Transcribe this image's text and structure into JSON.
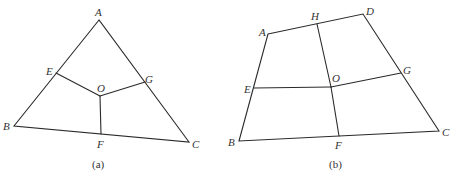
{
  "figures": [
    {
      "id": "a",
      "caption": "(a)",
      "shape": "triangle",
      "points": {
        "A": {
          "label": "A",
          "x": 99,
          "y": 20
        },
        "B": {
          "label": "B",
          "x": 14,
          "y": 126
        },
        "C": {
          "label": "C",
          "x": 189,
          "y": 142
        },
        "E": {
          "label": "E",
          "x": 56,
          "y": 73
        },
        "G": {
          "label": "G",
          "x": 145,
          "y": 82
        },
        "O": {
          "label": "O",
          "x": 100,
          "y": 96
        },
        "F": {
          "label": "F",
          "x": 101,
          "y": 134
        }
      },
      "edges": [
        [
          "A",
          "B"
        ],
        [
          "B",
          "C"
        ],
        [
          "C",
          "A"
        ],
        [
          "E",
          "O"
        ],
        [
          "G",
          "O"
        ],
        [
          "O",
          "F"
        ]
      ]
    },
    {
      "id": "b",
      "caption": "(b)",
      "shape": "quadrilateral",
      "points": {
        "A": {
          "label": "A",
          "x": 268,
          "y": 34
        },
        "H": {
          "label": "H",
          "x": 317,
          "y": 24
        },
        "D": {
          "label": "D",
          "x": 363,
          "y": 14
        },
        "E": {
          "label": "E",
          "x": 254,
          "y": 88
        },
        "O": {
          "label": "O",
          "x": 331,
          "y": 87
        },
        "G": {
          "label": "G",
          "x": 401,
          "y": 73
        },
        "B": {
          "label": "B",
          "x": 239,
          "y": 141
        },
        "F": {
          "label": "F",
          "x": 339,
          "y": 136
        },
        "C": {
          "label": "C",
          "x": 439,
          "y": 131
        }
      },
      "edges": [
        [
          "A",
          "D"
        ],
        [
          "D",
          "C"
        ],
        [
          "C",
          "B"
        ],
        [
          "B",
          "A"
        ],
        [
          "H",
          "O"
        ],
        [
          "O",
          "F"
        ],
        [
          "E",
          "O"
        ],
        [
          "O",
          "G"
        ]
      ]
    }
  ],
  "labels": {
    "a": {
      "A": "A",
      "B": "B",
      "C": "C",
      "E": "E",
      "G": "G",
      "O": "O",
      "F": "F",
      "caption": "(a)"
    },
    "b": {
      "A": "A",
      "H": "H",
      "D": "D",
      "E": "E",
      "O": "O",
      "G": "G",
      "B": "B",
      "F": "F",
      "C": "C",
      "caption": "(b)"
    }
  }
}
